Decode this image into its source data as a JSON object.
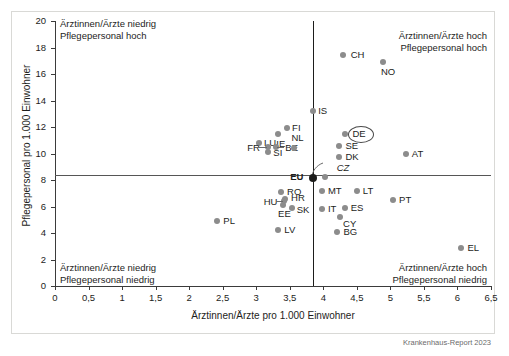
{
  "figure": {
    "source_note": "Krankenhaus-Report 2023"
  },
  "chart_data": {
    "type": "scatter",
    "title": "",
    "xlabel": "Ärztinnen/Ärzte pro 1.000 Einwohner",
    "ylabel": "Pflegepersonal pro 1.000 Einwohner",
    "xlim": [
      0,
      6.5
    ],
    "ylim": [
      0,
      20
    ],
    "xticks": [
      "0",
      "0,5",
      "1",
      "1,5",
      "2",
      "2,5",
      "3",
      "3,5",
      "4",
      "4,5",
      "5",
      "5,5",
      "6",
      "6,5"
    ],
    "xtick_values": [
      0,
      0.5,
      1,
      1.5,
      2,
      2.5,
      3,
      3.5,
      4,
      4.5,
      5,
      5.5,
      6,
      6.5
    ],
    "yticks": [
      "0",
      "2",
      "4",
      "6",
      "8",
      "10",
      "12",
      "14",
      "16",
      "18",
      "20"
    ],
    "ytick_values": [
      0,
      2,
      4,
      6,
      8,
      10,
      12,
      14,
      16,
      18,
      20
    ],
    "grid": false,
    "legend": "none",
    "reference_lines": {
      "vertical_x": 3.85,
      "horizontal_y": 8.4
    },
    "quadrant_annotations": [
      {
        "name": "top-left",
        "line1": "Ärztinnen/Ärzte niedrig",
        "line2": "Pflegepersonal hoch"
      },
      {
        "name": "top-right",
        "line1": "Ärztinnen/Ärzte hoch",
        "line2": "Pflegepersonal hoch"
      },
      {
        "name": "bottom-left",
        "line1": "Ärztinnen/Ärzte niedrig",
        "line2": "Pflegepersonal niedrig"
      },
      {
        "name": "bottom-right",
        "line1": "Ärztinnen/Ärzte hoch",
        "line2": "Pflegepersonal niedrig"
      }
    ],
    "points": [
      {
        "label": "CH",
        "x": 4.29,
        "y": 17.4,
        "lx": 8,
        "ly": -5,
        "style": "plain"
      },
      {
        "label": "NO",
        "x": 4.89,
        "y": 16.9,
        "lx": -2,
        "ly": 5,
        "style": "plain"
      },
      {
        "label": "IS",
        "x": 3.85,
        "y": 13.2,
        "lx": 5,
        "ly": -5,
        "style": "plain"
      },
      {
        "label": "FI",
        "x": 3.46,
        "y": 11.9,
        "lx": 5,
        "ly": -5,
        "style": "plain"
      },
      {
        "label": "IE",
        "x": 3.33,
        "y": 11.5,
        "lx": -2,
        "ly": 5,
        "style": "plain"
      },
      {
        "label": "LU",
        "x": 3.04,
        "y": 10.8,
        "lx": 5,
        "ly": -5,
        "style": "plain"
      },
      {
        "label": "FR",
        "x": 3.18,
        "y": 10.5,
        "lx": -21,
        "ly": -4,
        "style": "plain"
      },
      {
        "label": "BE",
        "x": 3.3,
        "y": 10.5,
        "lx": 9,
        "ly": -4,
        "style": "plain"
      },
      {
        "label": "SI",
        "x": 3.18,
        "y": 10.1,
        "lx": 5,
        "ly": -4,
        "style": "plain"
      },
      {
        "label": "NL",
        "x": 3.57,
        "y": 10.4,
        "lx": -3,
        "ly": -15,
        "style": "plain"
      },
      {
        "label": "DE",
        "x": 4.33,
        "y": 11.5,
        "lx": 7,
        "ly": -5,
        "style": "circled"
      },
      {
        "label": "SE",
        "x": 4.24,
        "y": 10.6,
        "lx": 6,
        "ly": -5,
        "style": "plain"
      },
      {
        "label": "DK",
        "x": 4.24,
        "y": 9.7,
        "lx": 6,
        "ly": -5,
        "style": "plain"
      },
      {
        "label": "AT",
        "x": 5.23,
        "y": 10.0,
        "lx": 6,
        "ly": -5,
        "style": "plain"
      },
      {
        "label": "CZ",
        "x": 4.02,
        "y": 8.2,
        "lx": 12,
        "ly": -14,
        "style": "leader"
      },
      {
        "label": "EU",
        "x": 3.85,
        "y": 8.15,
        "lx": -23,
        "ly": -6,
        "style": "eu"
      },
      {
        "label": "MT",
        "x": 3.98,
        "y": 7.2,
        "lx": 6,
        "ly": -5,
        "style": "plain"
      },
      {
        "label": "LT",
        "x": 4.5,
        "y": 7.2,
        "lx": 6,
        "ly": -5,
        "style": "plain"
      },
      {
        "label": "PT",
        "x": 5.04,
        "y": 6.5,
        "lx": 6,
        "ly": -5,
        "style": "plain"
      },
      {
        "label": "RO",
        "x": 3.37,
        "y": 7.1,
        "lx": 6,
        "ly": -5,
        "style": "plain"
      },
      {
        "label": "HR",
        "x": 3.43,
        "y": 6.6,
        "lx": 6,
        "ly": -6,
        "style": "plain"
      },
      {
        "label": "HU",
        "x": 3.41,
        "y": 6.4,
        "lx": -20,
        "ly": -4,
        "style": "plain"
      },
      {
        "label": "EE",
        "x": 3.4,
        "y": 6.1,
        "lx": -5,
        "ly": 4,
        "style": "plain"
      },
      {
        "label": "SK",
        "x": 3.53,
        "y": 5.9,
        "lx": 5,
        "ly": -3,
        "style": "plain"
      },
      {
        "label": "IT",
        "x": 3.98,
        "y": 5.8,
        "lx": 6,
        "ly": -5,
        "style": "plain"
      },
      {
        "label": "ES",
        "x": 4.32,
        "y": 5.9,
        "lx": 6,
        "ly": -5,
        "style": "plain"
      },
      {
        "label": "CY",
        "x": 4.25,
        "y": 5.2,
        "lx": 3,
        "ly": 2,
        "style": "plain"
      },
      {
        "label": "BG",
        "x": 4.21,
        "y": 4.1,
        "lx": 6,
        "ly": -5,
        "style": "plain"
      },
      {
        "label": "LV",
        "x": 3.33,
        "y": 4.2,
        "lx": 6,
        "ly": -5,
        "style": "plain"
      },
      {
        "label": "PL",
        "x": 2.42,
        "y": 4.9,
        "lx": 6,
        "ly": -5,
        "style": "plain"
      },
      {
        "label": "EL",
        "x": 6.06,
        "y": 2.9,
        "lx": 6,
        "ly": -5,
        "style": "plain"
      }
    ]
  }
}
